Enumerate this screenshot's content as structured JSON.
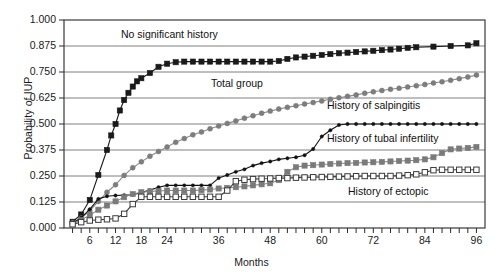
{
  "chart_data": {
    "type": "line",
    "title": "",
    "xlabel": "Months",
    "ylabel": "Probability of IUP",
    "xlim": [
      0,
      98
    ],
    "ylim": [
      0,
      1.0
    ],
    "grid": "horizontal",
    "legend_position": "inline-annotations",
    "y_ticks": [
      "0.000",
      "0.125",
      "0.250",
      "0.375",
      "0.500",
      "0.625",
      "0.750",
      "0.875",
      "1.000"
    ],
    "y_tick_values": [
      0.0,
      0.125,
      0.25,
      0.375,
      0.5,
      0.625,
      0.75,
      0.875,
      1.0
    ],
    "x_ticks": [
      "6",
      "12",
      "18",
      "24",
      "36",
      "48",
      "60",
      "72",
      "84",
      "96"
    ],
    "x_tick_values": [
      6,
      12,
      18,
      24,
      36,
      48,
      60,
      72,
      84,
      96
    ],
    "x_minor_tick_interval": 2,
    "series": [
      {
        "name": "No significant history",
        "marker": "filled-square",
        "color": "#1a1a1a",
        "line_color": "#1a1a1a",
        "x": [
          2,
          4,
          6,
          8,
          10,
          11,
          12,
          13,
          14,
          15,
          16,
          17,
          18,
          20,
          22,
          24,
          26,
          28,
          30,
          32,
          34,
          36,
          38,
          40,
          42,
          44,
          46,
          48,
          50,
          52,
          54,
          56,
          58,
          60,
          62,
          64,
          66,
          68,
          70,
          72,
          74,
          76,
          78,
          80,
          82,
          86,
          90,
          94,
          96
        ],
        "y": [
          0.03,
          0.065,
          0.135,
          0.255,
          0.375,
          0.445,
          0.5,
          0.565,
          0.615,
          0.65,
          0.68,
          0.705,
          0.72,
          0.745,
          0.775,
          0.79,
          0.797,
          0.8,
          0.8,
          0.8,
          0.8,
          0.8,
          0.8,
          0.8,
          0.8,
          0.8,
          0.8,
          0.8,
          0.803,
          0.813,
          0.82,
          0.824,
          0.828,
          0.832,
          0.836,
          0.84,
          0.843,
          0.846,
          0.849,
          0.852,
          0.855,
          0.858,
          0.862,
          0.866,
          0.869,
          0.872,
          0.875,
          0.878,
          0.888
        ]
      },
      {
        "name": "Total group",
        "marker": "filled-circle",
        "color": "#7d7d7d",
        "line_color": "#8a8a8a",
        "x": [
          2,
          4,
          6,
          8,
          10,
          12,
          14,
          16,
          18,
          20,
          22,
          24,
          26,
          28,
          30,
          32,
          34,
          36,
          38,
          40,
          42,
          44,
          46,
          48,
          50,
          52,
          54,
          56,
          58,
          60,
          62,
          64,
          66,
          68,
          70,
          72,
          74,
          76,
          78,
          80,
          82,
          84,
          86,
          88,
          90,
          92,
          94,
          96
        ],
        "y": [
          0.025,
          0.048,
          0.082,
          0.128,
          0.172,
          0.208,
          0.253,
          0.29,
          0.318,
          0.345,
          0.368,
          0.39,
          0.412,
          0.43,
          0.448,
          0.462,
          0.477,
          0.49,
          0.503,
          0.515,
          0.528,
          0.54,
          0.552,
          0.562,
          0.572,
          0.58,
          0.588,
          0.596,
          0.603,
          0.611,
          0.619,
          0.626,
          0.633,
          0.64,
          0.648,
          0.655,
          0.661,
          0.667,
          0.672,
          0.678,
          0.684,
          0.69,
          0.697,
          0.703,
          0.71,
          0.718,
          0.726,
          0.735
        ]
      },
      {
        "name": "History of salpingitis",
        "marker": "small-dot",
        "color": "#111111",
        "line_color": "#111111",
        "x": [
          2,
          4,
          6,
          8,
          10,
          12,
          14,
          16,
          18,
          20,
          22,
          24,
          26,
          28,
          30,
          32,
          34,
          36,
          38,
          40,
          42,
          44,
          46,
          48,
          50,
          52,
          54,
          56,
          58,
          60,
          62,
          64,
          66,
          68,
          70,
          72,
          74,
          76,
          78,
          80,
          82,
          84,
          86,
          88,
          90,
          92,
          94,
          96
        ],
        "y": [
          0.022,
          0.05,
          0.09,
          0.14,
          0.153,
          0.156,
          0.158,
          0.16,
          0.17,
          0.182,
          0.196,
          0.205,
          0.205,
          0.205,
          0.205,
          0.205,
          0.205,
          0.24,
          0.255,
          0.27,
          0.282,
          0.3,
          0.312,
          0.32,
          0.33,
          0.335,
          0.34,
          0.35,
          0.38,
          0.44,
          0.47,
          0.495,
          0.5,
          0.5,
          0.5,
          0.5,
          0.5,
          0.5,
          0.5,
          0.5,
          0.5,
          0.5,
          0.5,
          0.5,
          0.5,
          0.5,
          0.5,
          0.5
        ]
      },
      {
        "name": "History of tubal infertility",
        "marker": "filled-square",
        "color": "#7a7a7a",
        "line_color": "#8a8a8a",
        "x": [
          2,
          4,
          6,
          8,
          10,
          12,
          14,
          16,
          18,
          20,
          22,
          24,
          26,
          28,
          30,
          32,
          34,
          36,
          38,
          40,
          42,
          44,
          46,
          48,
          50,
          52,
          54,
          56,
          58,
          60,
          62,
          64,
          66,
          68,
          70,
          72,
          74,
          76,
          78,
          80,
          82,
          84,
          86,
          88,
          90,
          92,
          94,
          96
        ],
        "y": [
          0.02,
          0.038,
          0.062,
          0.088,
          0.108,
          0.128,
          0.148,
          0.163,
          0.172,
          0.176,
          0.178,
          0.18,
          0.18,
          0.18,
          0.18,
          0.182,
          0.185,
          0.19,
          0.193,
          0.196,
          0.2,
          0.205,
          0.21,
          0.215,
          0.23,
          0.27,
          0.292,
          0.3,
          0.302,
          0.305,
          0.308,
          0.31,
          0.312,
          0.313,
          0.315,
          0.316,
          0.318,
          0.32,
          0.322,
          0.324,
          0.326,
          0.33,
          0.34,
          0.36,
          0.378,
          0.382,
          0.385,
          0.39
        ]
      },
      {
        "name": "History of ectopic",
        "marker": "open-square",
        "color": "#ffffff",
        "line_color": "#3a3a3a",
        "x": [
          2,
          4,
          6,
          8,
          10,
          12,
          14,
          16,
          18,
          20,
          22,
          24,
          26,
          28,
          30,
          32,
          34,
          36,
          38,
          40,
          42,
          44,
          46,
          48,
          50,
          52,
          54,
          56,
          58,
          60,
          62,
          64,
          66,
          68,
          70,
          72,
          74,
          76,
          78,
          80,
          82,
          84,
          86,
          88,
          90,
          92,
          94,
          96
        ],
        "y": [
          0.018,
          0.028,
          0.036,
          0.04,
          0.042,
          0.046,
          0.068,
          0.115,
          0.15,
          0.15,
          0.15,
          0.15,
          0.15,
          0.15,
          0.15,
          0.15,
          0.15,
          0.15,
          0.18,
          0.225,
          0.232,
          0.235,
          0.237,
          0.238,
          0.24,
          0.24,
          0.242,
          0.243,
          0.244,
          0.245,
          0.246,
          0.247,
          0.248,
          0.249,
          0.25,
          0.25,
          0.25,
          0.25,
          0.252,
          0.254,
          0.258,
          0.268,
          0.278,
          0.28,
          0.28,
          0.28,
          0.28,
          0.28
        ]
      }
    ],
    "annotations": [
      {
        "text": "No significant history",
        "x_px": 121,
        "y_px": 28
      },
      {
        "text": "Total group",
        "x_px": 211,
        "y_px": 77
      },
      {
        "text": "History of salpingitis",
        "x_px": 327,
        "y_px": 99
      },
      {
        "text": "History of tubal infertility",
        "x_px": 327,
        "y_px": 132
      },
      {
        "text": "History of ectopic",
        "x_px": 348,
        "y_px": 185
      }
    ]
  }
}
